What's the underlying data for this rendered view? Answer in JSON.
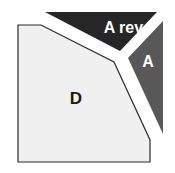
{
  "diagram": {
    "regions": [
      {
        "id": "d",
        "label": "D",
        "fill": "#f0f0f0",
        "stroke": "#2b2b2b",
        "text_color": "#1a1a1a"
      },
      {
        "id": "a_rev",
        "label": "A rev.",
        "fill": "#262626",
        "text_color": "#ffffff"
      },
      {
        "id": "a",
        "label": "A",
        "fill": "#585858",
        "text_color": "#ffffff"
      }
    ]
  }
}
